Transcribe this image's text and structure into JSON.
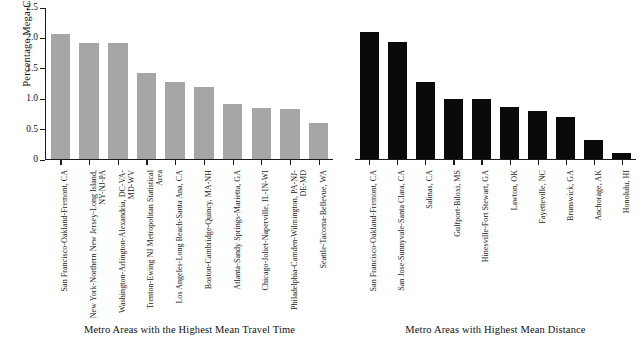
{
  "chart_data": {
    "type": "bar",
    "title": "",
    "subtitle": "",
    "xlabel": "",
    "ylabel": "Percentage Mega-Commutes",
    "ylim": [
      0,
      2.5
    ],
    "yticks": [
      "0",
      "0.5",
      "1.0",
      "1.5",
      "2.0",
      "2.5"
    ],
    "ytick_values": [
      0,
      0.5,
      1.0,
      1.5,
      2.0,
      2.5
    ],
    "grid": false,
    "legend": "none",
    "panels": [
      {
        "caption": "Metro Areas with the Highest Mean Travel Time",
        "bar_color": "#a6a6a6",
        "categories": [
          "San Francisco-Oakland-Fremont, CA",
          "New York-Northern New Jersey-Long Island, NY-NJ-PA",
          "Washington-Arlington-Alexandria, DC-VA-MD-WV",
          "Trenton-Ewing NJ Metropolitan Statistical Area",
          "Los Angeles-Long Beach-Santa Ana, CA",
          "Boston-Cambridge-Quincy, MA-NH",
          "Atlanta-Sandy Springs-Marietta, GA",
          "Chicago-Joliet-Naperville, IL-IN-WI",
          "Philadelphia-Camden-Wilmington, PA-NJ-DE-MD",
          "Seattle-Tacoma-Bellevue, WA"
        ],
        "values": [
          2.06,
          1.91,
          1.9,
          1.42,
          1.26,
          1.18,
          0.91,
          0.84,
          0.83,
          0.6
        ]
      },
      {
        "caption": "Metro Areas with Highest Mean Distance",
        "bar_color": "#0a0a0a",
        "categories": [
          "San Francisco-Oakland-Fremont, CA",
          "San Jose-Sunnyvale-Santa Clara, CA",
          "Salinas, CA",
          "Gulfport-Biloxi, MS",
          "Hinesville-Fort Stewart, GA",
          "Lawton, OK",
          "Fayetteville, NC",
          "Brunswick, GA",
          "Anchorage, AK",
          "Honolulu, HI"
        ],
        "values": [
          2.09,
          1.93,
          1.27,
          0.98,
          0.99,
          0.86,
          0.79,
          0.69,
          0.31,
          0.1
        ]
      }
    ]
  }
}
